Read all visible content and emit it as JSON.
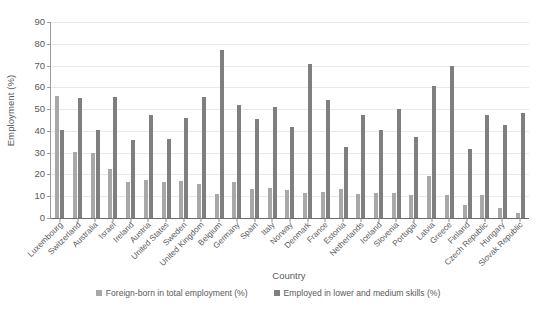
{
  "chart_data": {
    "type": "bar",
    "title": "",
    "xlabel": "Country",
    "ylabel": "Employment (%)",
    "ylim": [
      0,
      90
    ],
    "ytick_step": 10,
    "yticks": [
      0,
      10,
      20,
      30,
      40,
      50,
      60,
      70,
      80,
      90
    ],
    "grid": true,
    "legend_position": "bottom",
    "categories": [
      "Luxembourg",
      "Switzerland",
      "Australia",
      "Israel",
      "Ireland",
      "Austria",
      "United States",
      "Sweden",
      "United Kingdom",
      "Belgium",
      "Germany",
      "Spain",
      "Italy",
      "Norway",
      "Denmark",
      "France",
      "Estonia",
      "Netherlands",
      "Iceland",
      "Slovenia",
      "Portugal",
      "Latvia",
      "Greece",
      "Finland",
      "Czech Republic",
      "Hungary",
      "Slovak Republic"
    ],
    "series": [
      {
        "name": "Foreign-born in total employment (%)",
        "color": "#a8a8a8",
        "values": [
          56.0,
          30.5,
          30.0,
          22.5,
          16.5,
          17.5,
          16.5,
          17.0,
          15.5,
          11.0,
          16.5,
          13.5,
          14.0,
          13.0,
          11.5,
          12.0,
          13.5,
          11.0,
          11.5,
          11.5,
          10.5,
          19.5,
          10.5,
          6.0,
          10.5,
          4.5,
          2.5
        ]
      },
      {
        "name": "Employed in lower and medium skills (%)",
        "color": "#7f7f7f",
        "values": [
          40.5,
          55.0,
          40.5,
          55.5,
          36.0,
          47.5,
          36.5,
          46.0,
          55.5,
          77.0,
          52.0,
          45.5,
          51.0,
          42.0,
          70.5,
          54.0,
          32.5,
          47.5,
          40.5,
          50.0,
          37.0,
          60.5,
          70.0,
          31.5,
          47.5,
          42.5,
          48.0
        ]
      }
    ]
  },
  "legend": {
    "entries": [
      {
        "label": "Foreign-born in total employment (%)"
      },
      {
        "label": "Employed in lower and medium skills (%)"
      }
    ]
  }
}
